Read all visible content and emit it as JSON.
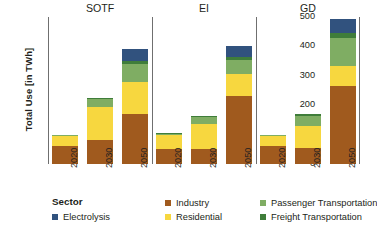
{
  "chart_data": {
    "type": "bar",
    "subtype": "stacked-grouped",
    "title": "",
    "xlabel": "",
    "ylabel": "Total Use [in TWh]",
    "ylim": [
      0,
      500
    ],
    "yticks": [
      0,
      100,
      200,
      300,
      400,
      500
    ],
    "grid": false,
    "legend_position": "bottom",
    "legend_title": "Sector",
    "groups": [
      "SOTF",
      "EI",
      "GD"
    ],
    "categories": [
      "2020",
      "2030",
      "2050"
    ],
    "series": [
      {
        "name": "Industry",
        "color": "#a05a1e",
        "values": {
          "SOTF": [
            60,
            80,
            170
          ],
          "EI": [
            52,
            50,
            230
          ],
          "GD": [
            60,
            55,
            265
          ]
        }
      },
      {
        "name": "Residential",
        "color": "#f7d73f",
        "values": {
          "SOTF": [
            35,
            115,
            110
          ],
          "EI": [
            48,
            85,
            75
          ],
          "GD": [
            35,
            75,
            70
          ]
        }
      },
      {
        "name": "Passenger Transportation",
        "color": "#7fad63",
        "values": {
          "SOTF": [
            3,
            25,
            60
          ],
          "EI": [
            3,
            25,
            50
          ],
          "GD": [
            3,
            35,
            95
          ]
        }
      },
      {
        "name": "Freight Transportation",
        "color": "#3f7d3a",
        "values": {
          "SOTF": [
            2,
            5,
            10
          ],
          "EI": [
            2,
            5,
            10
          ],
          "GD": [
            2,
            5,
            15
          ]
        }
      },
      {
        "name": "Electrolysis",
        "color": "#31527e",
        "values": {
          "SOTF": [
            0,
            0,
            40
          ],
          "EI": [
            0,
            0,
            35
          ],
          "GD": [
            0,
            0,
            50
          ]
        }
      }
    ],
    "totals": {
      "SOTF": [
        100,
        225,
        390
      ],
      "EI": [
        105,
        165,
        400
      ],
      "GD": [
        100,
        170,
        495
      ]
    }
  },
  "legend": {
    "title": "Sector",
    "columns": [
      {
        "items": [
          {
            "label": "Electrolysis",
            "color": "#31527e"
          }
        ]
      },
      {
        "items": [
          {
            "label": "Industry",
            "color": "#a05a1e"
          },
          {
            "label": "Residential",
            "color": "#f7d73f"
          }
        ]
      },
      {
        "items": [
          {
            "label": "Passenger Transportation",
            "color": "#7fad63"
          },
          {
            "label": "Freight Transportation",
            "color": "#3f7d3a"
          }
        ]
      }
    ]
  }
}
